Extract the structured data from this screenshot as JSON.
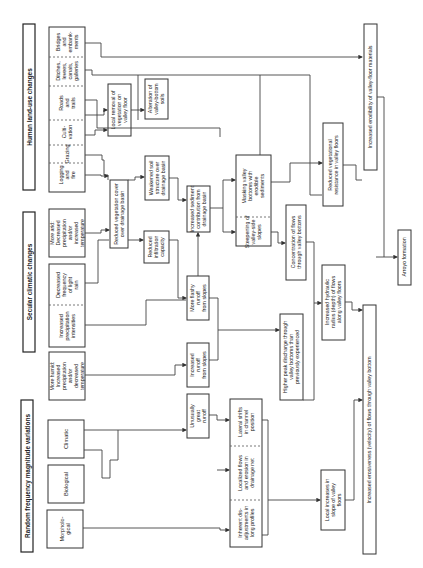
{
  "headers": {
    "human": "Human land-use changes",
    "secular": "Secular climatic changes",
    "random": "Random frequency magnitude variations"
  },
  "human_causes": [
    [
      "Logging",
      "and",
      "fire"
    ],
    [
      "Grazing"
    ],
    [
      "Culti-",
      "vation"
    ],
    [
      "Roads",
      "and",
      "trails"
    ],
    [
      "Ditches,",
      "levees,",
      "canals,",
      "galleries"
    ],
    [
      "Bridges",
      "and",
      "embank-",
      "ments"
    ]
  ],
  "secular_causes": {
    "drier": [
      "More arid:",
      "Decreased",
      "precipitation",
      "and/or",
      "increased",
      "temperature"
    ],
    "light_rain": [
      "Decreased",
      "frequency",
      "of light",
      "rain"
    ],
    "intensities": [
      "Increased",
      "precipitation",
      "intensities"
    ],
    "humid": [
      "More humid:",
      "Increased",
      "precipitation",
      "and/or",
      "decreased",
      "temperature"
    ]
  },
  "random_causes": {
    "climatic": [
      "Climatic"
    ],
    "biological": [
      "Biological"
    ],
    "morphological": [
      "Morpholo-",
      "gical"
    ]
  },
  "effects": {
    "local_removal": [
      "Local removal of",
      "vegetation on",
      "valley floor"
    ],
    "alteration_soils": [
      "Alteration of",
      "valley-bottom",
      "soils"
    ],
    "reduced_veg_cover": [
      "Reduced vegetation cover",
      "over drainage basin"
    ],
    "weakened_soil": [
      "Weakened soil",
      "structure over",
      "drainage basin"
    ],
    "reduced_infiltration": [
      "Reduced",
      "infiltration",
      "capacity"
    ],
    "increased_sediment": [
      "Increased sediment",
      "contribution from",
      "drainage basin"
    ],
    "more_flashy": [
      "More flashy",
      "runoff",
      "from slopes"
    ],
    "increased_runoff": [
      "Increased",
      "runoff",
      "from slopes"
    ],
    "unusually_great": [
      "Unusually",
      "great",
      "runoff"
    ],
    "masking": [
      "Masking valley",
      "bottoms with",
      "erodible",
      "sediments"
    ],
    "steepening": [
      "Steepening of",
      "valley-side",
      "slopes"
    ],
    "inherent": [
      "Inherent dis-",
      "adjustments in",
      "long profiles"
    ],
    "localized": [
      "Localized flows",
      "and erosion in",
      "drainage net"
    ],
    "lateral": [
      "Lateral shifts",
      "in channel",
      "position"
    ],
    "concentration": [
      "Concentration of flows",
      "through valley bottoms"
    ],
    "higher_peak": [
      "Higher peak discharge through",
      "valley bottoms than",
      "previously experienced"
    ],
    "hydraulic_radius": [
      "Increased hydraulic",
      "radius (depth) of flows",
      "along valley floors"
    ],
    "reduced_resistance": [
      "Reduced vegetational",
      "resistance in valley floors"
    ],
    "local_slope": [
      "Local increases in",
      "slope of valley",
      "floors"
    ],
    "erodibility": [
      "Increased erodibility of valley-floor materials"
    ],
    "erosiveness": [
      "Increased erosiveness (velocity) of flows through valley bottom"
    ],
    "arroyo": [
      "Arroyo formation"
    ]
  }
}
